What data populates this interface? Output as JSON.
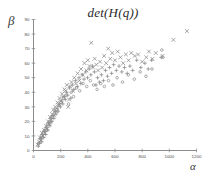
{
  "chart_data": {
    "type": "scatter",
    "title": "det(H(q))",
    "xlabel": "α",
    "ylabel": "β",
    "xlim": [
      0,
      1200
    ],
    "ylim": [
      0,
      90
    ],
    "xticks": [
      0,
      200,
      400,
      600,
      800,
      1000,
      1200
    ],
    "yticks": [
      0,
      10,
      20,
      30,
      40,
      50,
      60,
      70,
      80,
      90
    ],
    "xtick_labels": [
      "0",
      "200",
      "400",
      "600",
      "800",
      "1000",
      "1200"
    ],
    "ytick_labels": [
      "0",
      "10",
      "20",
      "30",
      "40",
      "50",
      "60",
      "70",
      "80",
      "90"
    ],
    "grid": false,
    "legend": "none",
    "marker_color": "#8a8a8a",
    "axis_color": "#8c8c8c",
    "series": [
      {
        "name": "cross-marker-series",
        "marker": "x",
        "points": [
          [
            30,
            4
          ],
          [
            42,
            6
          ],
          [
            48,
            9
          ],
          [
            55,
            7
          ],
          [
            62,
            12
          ],
          [
            70,
            10
          ],
          [
            78,
            14
          ],
          [
            85,
            12
          ],
          [
            92,
            17
          ],
          [
            100,
            15
          ],
          [
            108,
            20
          ],
          [
            115,
            18
          ],
          [
            122,
            23
          ],
          [
            130,
            21
          ],
          [
            138,
            25
          ],
          [
            145,
            28
          ],
          [
            152,
            24
          ],
          [
            160,
            30
          ],
          [
            168,
            27
          ],
          [
            176,
            33
          ],
          [
            185,
            31
          ],
          [
            192,
            36
          ],
          [
            200,
            34
          ],
          [
            210,
            39
          ],
          [
            218,
            37
          ],
          [
            228,
            42
          ],
          [
            236,
            41
          ],
          [
            245,
            45
          ],
          [
            255,
            30
          ],
          [
            262,
            35
          ],
          [
            270,
            44
          ],
          [
            280,
            47
          ],
          [
            290,
            41
          ],
          [
            300,
            50
          ],
          [
            312,
            46
          ],
          [
            325,
            53
          ],
          [
            338,
            48
          ],
          [
            350,
            56
          ],
          [
            362,
            52
          ],
          [
            375,
            60
          ],
          [
            390,
            55
          ],
          [
            400,
            62
          ],
          [
            412,
            58
          ],
          [
            425,
            74
          ],
          [
            438,
            57
          ],
          [
            450,
            63
          ],
          [
            462,
            59
          ],
          [
            475,
            55
          ],
          [
            490,
            61
          ],
          [
            505,
            57
          ],
          [
            520,
            65
          ],
          [
            535,
            60
          ],
          [
            550,
            70
          ],
          [
            565,
            63
          ],
          [
            580,
            67
          ],
          [
            600,
            62
          ],
          [
            620,
            68
          ],
          [
            640,
            64
          ],
          [
            660,
            60
          ],
          [
            680,
            66
          ],
          [
            700,
            62
          ],
          [
            720,
            67
          ],
          [
            745,
            65
          ],
          [
            770,
            66
          ],
          [
            800,
            61
          ],
          [
            830,
            64
          ],
          [
            850,
            68
          ],
          [
            875,
            63
          ],
          [
            900,
            67
          ],
          [
            950,
            65
          ],
          [
            1030,
            76
          ],
          [
            1130,
            82
          ]
        ]
      },
      {
        "name": "plus-marker-series",
        "marker": "+",
        "points": [
          [
            35,
            3
          ],
          [
            45,
            5
          ],
          [
            52,
            8
          ],
          [
            60,
            6
          ],
          [
            68,
            11
          ],
          [
            75,
            9
          ],
          [
            82,
            13
          ],
          [
            90,
            11
          ],
          [
            98,
            16
          ],
          [
            105,
            14
          ],
          [
            112,
            19
          ],
          [
            120,
            17
          ],
          [
            128,
            22
          ],
          [
            135,
            20
          ],
          [
            142,
            24
          ],
          [
            150,
            22
          ],
          [
            158,
            27
          ],
          [
            166,
            25
          ],
          [
            174,
            29
          ],
          [
            182,
            27
          ],
          [
            190,
            32
          ],
          [
            198,
            30
          ],
          [
            208,
            34
          ],
          [
            216,
            32
          ],
          [
            226,
            37
          ],
          [
            234,
            35
          ],
          [
            244,
            40
          ],
          [
            252,
            38
          ],
          [
            265,
            43
          ],
          [
            275,
            36
          ],
          [
            285,
            45
          ],
          [
            298,
            42
          ],
          [
            310,
            48
          ],
          [
            322,
            44
          ],
          [
            335,
            50
          ],
          [
            348,
            46
          ],
          [
            360,
            52
          ],
          [
            372,
            49
          ],
          [
            385,
            54
          ],
          [
            398,
            50
          ],
          [
            410,
            56
          ],
          [
            422,
            52
          ],
          [
            435,
            58
          ],
          [
            448,
            54
          ],
          [
            460,
            45
          ],
          [
            472,
            50
          ],
          [
            485,
            47
          ],
          [
            500,
            52
          ],
          [
            515,
            48
          ],
          [
            530,
            55
          ],
          [
            545,
            51
          ],
          [
            560,
            57
          ],
          [
            575,
            53
          ],
          [
            590,
            59
          ],
          [
            610,
            55
          ],
          [
            630,
            58
          ],
          [
            650,
            54
          ],
          [
            670,
            57
          ],
          [
            690,
            53
          ],
          [
            710,
            58
          ],
          [
            730,
            55
          ],
          [
            760,
            62
          ],
          [
            790,
            57
          ],
          [
            820,
            60
          ],
          [
            845,
            56
          ],
          [
            870,
            62
          ],
          [
            940,
            64
          ]
        ]
      },
      {
        "name": "dot-marker-series",
        "marker": "o",
        "points": [
          [
            38,
            5
          ],
          [
            50,
            8
          ],
          [
            58,
            10
          ],
          [
            66,
            9
          ],
          [
            74,
            13
          ],
          [
            88,
            15
          ],
          [
            96,
            14
          ],
          [
            104,
            18
          ],
          [
            118,
            20
          ],
          [
            126,
            19
          ],
          [
            140,
            23
          ],
          [
            155,
            26
          ],
          [
            170,
            28
          ],
          [
            188,
            31
          ],
          [
            204,
            33
          ],
          [
            222,
            36
          ],
          [
            240,
            38
          ],
          [
            258,
            32
          ],
          [
            278,
            40
          ],
          [
            295,
            37
          ],
          [
            318,
            43
          ],
          [
            340,
            41
          ],
          [
            365,
            46
          ],
          [
            392,
            44
          ],
          [
            418,
            48
          ],
          [
            442,
            45
          ],
          [
            468,
            42
          ],
          [
            495,
            46
          ],
          [
            522,
            44
          ],
          [
            552,
            48
          ],
          [
            585,
            45
          ],
          [
            615,
            50
          ],
          [
            655,
            47
          ],
          [
            698,
            52
          ],
          [
            742,
            49
          ],
          [
            785,
            54
          ],
          [
            828,
            51
          ],
          [
            872,
            56
          ],
          [
            945,
            69
          ],
          [
            952,
            64
          ]
        ]
      }
    ]
  }
}
